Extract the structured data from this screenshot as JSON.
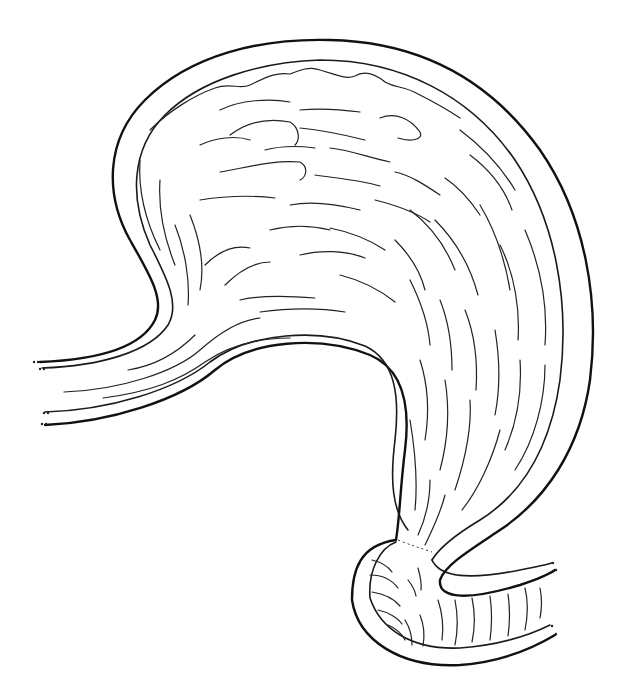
{
  "figure": {
    "background": "#ffffff",
    "stroke_color": "#111111",
    "regions": [
      "esophagus",
      "fundus",
      "body",
      "greater-curvature",
      "lesser-curvature",
      "pyloric-antrum",
      "pylorus",
      "duodenum"
    ]
  }
}
